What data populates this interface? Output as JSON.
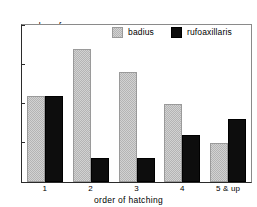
{
  "chart_data": {
    "type": "bar",
    "title": "",
    "xlabel": "order of hatching",
    "ylabel": "number of nestlings",
    "ylabel_line1": "number of",
    "ylabel_line2": "nestlings",
    "categories": [
      "1",
      "2",
      "3",
      "4",
      "5 & up"
    ],
    "series": [
      {
        "name": "badius",
        "values": [
          11,
          17,
          14,
          10,
          5
        ],
        "color": "#b4b4b4"
      },
      {
        "name": "rufoaxillaris",
        "values": [
          11,
          3,
          3,
          6,
          8
        ],
        "color": "#0d0d0d"
      }
    ],
    "ylim": [
      0,
      20
    ],
    "yticks": [
      0,
      5,
      10,
      15,
      20
    ],
    "ytick_labels": [
      "0",
      "5",
      "10",
      "15",
      "20"
    ],
    "grid": false,
    "legend_position": "top-center"
  },
  "legend": {
    "items": [
      {
        "label": "badius",
        "swatch": "badius-swatch"
      },
      {
        "label": "rufoaxillaris",
        "swatch": "rufoaxillaris-swatch"
      }
    ]
  }
}
